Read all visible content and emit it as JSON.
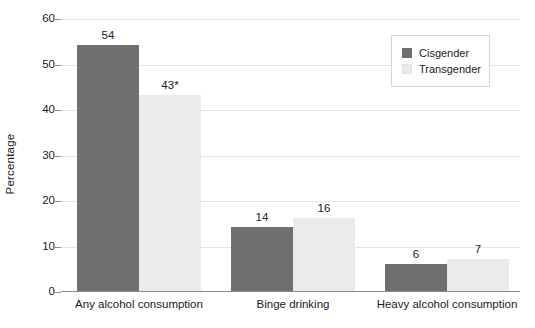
{
  "chart_data": {
    "type": "bar",
    "title": "",
    "subtitle": "",
    "xlabel": "",
    "ylabel": "Percentage",
    "ylim": [
      0,
      60
    ],
    "yticks": [
      0,
      10,
      20,
      30,
      40,
      50,
      60
    ],
    "ytick_labels": [
      "0",
      "10",
      "20",
      "30",
      "40",
      "50",
      "60"
    ],
    "grid": true,
    "grid_axis": "y",
    "legend_position": "top-right",
    "categories": [
      "Any alcohol consumption",
      "Binge drinking",
      "Heavy alcohol consumption"
    ],
    "series": [
      {
        "name": "Cisgender",
        "color": "#6f6f6f",
        "values": [
          54,
          14,
          6
        ],
        "data_labels": [
          "54",
          "14",
          "6"
        ]
      },
      {
        "name": "Transgender",
        "color": "#ebebeb",
        "values": [
          43,
          16,
          7
        ],
        "data_labels": [
          "43*",
          "16",
          "7"
        ]
      }
    ],
    "annotations": [
      "* denotes statistically significant difference"
    ]
  },
  "legend": {
    "entries": [
      {
        "label": "Cisgender",
        "color": "#6f6f6f"
      },
      {
        "label": "Transgender",
        "color": "#ebebeb"
      }
    ]
  },
  "axes": {
    "y_title": "Percentage"
  },
  "colors": {
    "cisgender": "#6f6f6f",
    "transgender": "#ebebeb",
    "gridline": "#e3e3e3",
    "axis": "#8c8c8c",
    "text": "#1a1a1a",
    "background": "#ffffff"
  }
}
